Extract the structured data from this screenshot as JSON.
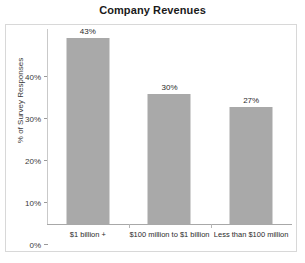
{
  "chart_data": {
    "type": "bar",
    "title": "Company Revenues",
    "xlabel": "",
    "ylabel": "% of Survey Responses",
    "categories": [
      "$1 billion +",
      "$100 million to $1 billion",
      "Less than $100 million"
    ],
    "values": [
      43,
      30,
      27
    ],
    "value_labels": [
      "43%",
      "30%",
      "27%"
    ],
    "ylim": [
      0,
      45
    ],
    "yticks": [
      0,
      10,
      20,
      30,
      40
    ],
    "ytick_labels": [
      "0%",
      "10%",
      "20%",
      "30%",
      "40%"
    ],
    "grid": false,
    "legend": "none",
    "bar_color": "#a9a9a9",
    "frame_color": "#d8d8d8",
    "axis_color": "#a8a8a8",
    "text_color": "#2a2a2a"
  }
}
